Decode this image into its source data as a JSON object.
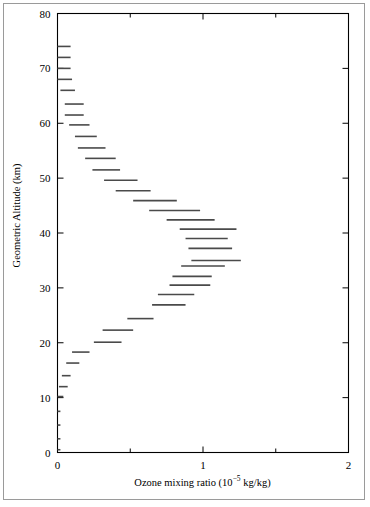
{
  "figure": {
    "background": "#ffffff",
    "frame_color": "#000000",
    "outer_border_color": "#9a9a9a",
    "data_color": "#4a4a4a"
  },
  "chart_data": {
    "type": "bar",
    "orientation": "horizontal-steps",
    "title": "",
    "xlabel": "Ozone mixing ratio (10−5 kg/kg)",
    "xlabel_parts": {
      "text_before": "Ozone mixing ratio (10",
      "exponent": "−5",
      "text_after": " kg/kg)"
    },
    "ylabel": "Geometric Altitude (km)",
    "xlim": [
      0,
      2
    ],
    "ylim": [
      0,
      80
    ],
    "xticks": [
      0,
      1,
      2
    ],
    "xticklabels": [
      "0",
      "1",
      "2"
    ],
    "xminorticks": [
      0.5,
      1.5
    ],
    "yticks": [
      0,
      10,
      20,
      30,
      40,
      50,
      60,
      70,
      80
    ],
    "yticklabels": [
      "0",
      "10",
      "20",
      "30",
      "40",
      "50",
      "60",
      "70",
      "80"
    ],
    "grid": false,
    "legend": null,
    "note": "Each datum is a horizontal segment spanning the ozone mixing ratio range for one altitude layer; segment drawn at layer mid-altitude.",
    "segments": [
      {
        "altitude_km": 74.0,
        "x_start": 0.0,
        "x_end": 0.09
      },
      {
        "altitude_km": 72.0,
        "x_start": 0.0,
        "x_end": 0.09
      },
      {
        "altitude_km": 70.0,
        "x_start": 0.0,
        "x_end": 0.09
      },
      {
        "altitude_km": 68.0,
        "x_start": 0.0,
        "x_end": 0.1
      },
      {
        "altitude_km": 66.0,
        "x_start": 0.02,
        "x_end": 0.12
      },
      {
        "altitude_km": 63.5,
        "x_start": 0.05,
        "x_end": 0.18
      },
      {
        "altitude_km": 61.5,
        "x_start": 0.05,
        "x_end": 0.18
      },
      {
        "altitude_km": 59.7,
        "x_start": 0.08,
        "x_end": 0.22
      },
      {
        "altitude_km": 57.6,
        "x_start": 0.12,
        "x_end": 0.27
      },
      {
        "altitude_km": 55.5,
        "x_start": 0.14,
        "x_end": 0.33
      },
      {
        "altitude_km": 53.6,
        "x_start": 0.19,
        "x_end": 0.4
      },
      {
        "altitude_km": 51.5,
        "x_start": 0.24,
        "x_end": 0.43
      },
      {
        "altitude_km": 49.6,
        "x_start": 0.32,
        "x_end": 0.55
      },
      {
        "altitude_km": 47.7,
        "x_start": 0.4,
        "x_end": 0.64
      },
      {
        "altitude_km": 45.9,
        "x_start": 0.52,
        "x_end": 0.82
      },
      {
        "altitude_km": 44.1,
        "x_start": 0.63,
        "x_end": 0.98
      },
      {
        "altitude_km": 42.4,
        "x_start": 0.75,
        "x_end": 1.08
      },
      {
        "altitude_km": 40.7,
        "x_start": 0.84,
        "x_end": 1.23
      },
      {
        "altitude_km": 39.0,
        "x_start": 0.88,
        "x_end": 1.17
      },
      {
        "altitude_km": 37.2,
        "x_start": 0.9,
        "x_end": 1.2
      },
      {
        "altitude_km": 35.0,
        "x_start": 0.92,
        "x_end": 1.26
      },
      {
        "altitude_km": 34.0,
        "x_start": 0.85,
        "x_end": 1.15
      },
      {
        "altitude_km": 32.1,
        "x_start": 0.79,
        "x_end": 1.06
      },
      {
        "altitude_km": 30.5,
        "x_start": 0.77,
        "x_end": 1.05
      },
      {
        "altitude_km": 28.8,
        "x_start": 0.69,
        "x_end": 0.94
      },
      {
        "altitude_km": 26.9,
        "x_start": 0.65,
        "x_end": 0.88
      },
      {
        "altitude_km": 24.4,
        "x_start": 0.48,
        "x_end": 0.66
      },
      {
        "altitude_km": 22.3,
        "x_start": 0.31,
        "x_end": 0.52
      },
      {
        "altitude_km": 20.1,
        "x_start": 0.25,
        "x_end": 0.44
      },
      {
        "altitude_km": 18.3,
        "x_start": 0.1,
        "x_end": 0.22
      },
      {
        "altitude_km": 16.3,
        "x_start": 0.06,
        "x_end": 0.15
      },
      {
        "altitude_km": 14.0,
        "x_start": 0.03,
        "x_end": 0.09
      },
      {
        "altitude_km": 12.0,
        "x_start": 0.01,
        "x_end": 0.07
      },
      {
        "altitude_km": 10.2,
        "x_start": 0.0,
        "x_end": 0.04
      },
      {
        "altitude_km": 7.5,
        "x_start": 0.0,
        "x_end": 0.02
      },
      {
        "altitude_km": 5.0,
        "x_start": 0.0,
        "x_end": 0.02
      },
      {
        "altitude_km": 2.5,
        "x_start": 0.0,
        "x_end": 0.02
      },
      {
        "altitude_km": 0.5,
        "x_start": 0.0,
        "x_end": 0.02
      }
    ]
  }
}
